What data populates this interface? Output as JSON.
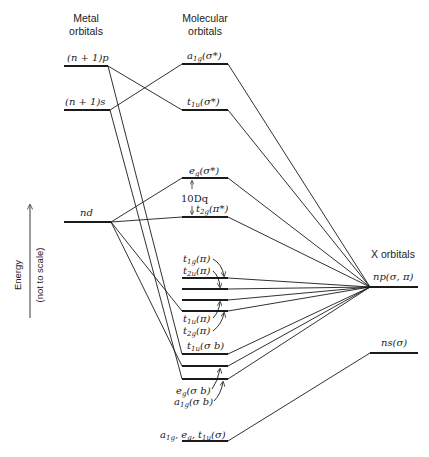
{
  "headers": {
    "metal_line1": "Metal",
    "metal_line2": "orbitals",
    "mo_line1": "Molecular",
    "mo_line2": "orbitals",
    "x_orbitals": "X orbitals"
  },
  "axis": {
    "label": "Energy",
    "note": "(not to scale)"
  },
  "metal_levels": {
    "np1": {
      "main": "(n + 1)p"
    },
    "ns1": {
      "main": "(n + 1)s"
    },
    "nd": {
      "main": "nd"
    }
  },
  "molecular_levels": {
    "a1g_star": {
      "main": "a",
      "sub": "1g",
      "tail": "(σ*)"
    },
    "t1u_star": {
      "main": "t",
      "sub": "1u",
      "tail": "(σ*)"
    },
    "eg_star": {
      "main": "e",
      "sub": "g",
      "tail": "(σ*)"
    },
    "ten_dq": "10Dq",
    "t2g_pistar": {
      "main": "t",
      "sub": "2g",
      "tail": "(π*)"
    },
    "t1g_pi": {
      "main": "t",
      "sub": "1g",
      "tail": "(π)"
    },
    "t2u_pi": {
      "main": "t",
      "sub": "2u",
      "tail": "(π)"
    },
    "t1u_pi": {
      "main": "t",
      "sub": "1u",
      "tail": "(π)"
    },
    "t2g_pi": {
      "main": "t",
      "sub": "2g",
      "tail": "(π)"
    },
    "t1u_sb": {
      "main": "t",
      "sub": "1u",
      "tail": "(σ b)"
    },
    "eg_sb": {
      "main": "e",
      "sub": "g",
      "tail": "(σ b)"
    },
    "a1g_sb": {
      "main": "a",
      "sub": "1g",
      "tail": "(σ b)"
    },
    "bottom": {
      "a": "a",
      "a_sub": "1g",
      "e": ", e",
      "e_sub": "g",
      "t": ", t",
      "t_sub": "1u",
      "tail": "(σ)"
    }
  },
  "ligand_levels": {
    "np": "np(σ, π)",
    "ns": "ns(σ)"
  }
}
